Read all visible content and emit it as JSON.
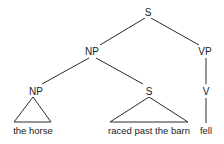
{
  "diagram": {
    "type": "syntax-parse-tree",
    "nodes": {
      "root": {
        "label": "S",
        "x": 148,
        "y": 8
      },
      "subject_np": {
        "label": "NP",
        "x": 92,
        "y": 47
      },
      "vp": {
        "label": "VP",
        "x": 205,
        "y": 47
      },
      "det_np": {
        "label": "NP",
        "x": 36,
        "y": 87
      },
      "relative_s": {
        "label": "S",
        "x": 149,
        "y": 87
      },
      "v": {
        "label": "V",
        "x": 206,
        "y": 87
      }
    },
    "leaves": {
      "np_leaf": {
        "text": "the horse",
        "x": 33,
        "y": 126
      },
      "s_leaf": {
        "text": "raced past the barn",
        "x": 149,
        "y": 126
      },
      "v_leaf": {
        "text": "fell",
        "x": 206,
        "y": 126
      }
    },
    "edges": [
      {
        "from": "S",
        "to": "NP",
        "x1": 145,
        "y1": 18,
        "x2": 100,
        "y2": 45
      },
      {
        "from": "S",
        "to": "VP",
        "x1": 151,
        "y1": 18,
        "x2": 199,
        "y2": 45
      },
      {
        "from": "NP",
        "to": "NP",
        "x1": 89,
        "y1": 58,
        "x2": 42,
        "y2": 84
      },
      {
        "from": "NP",
        "to": "S",
        "x1": 96,
        "y1": 58,
        "x2": 143,
        "y2": 84
      },
      {
        "from": "VP",
        "to": "V",
        "x1": 206,
        "y1": 58,
        "x2": 206,
        "y2": 84
      },
      {
        "from": "V",
        "to": "fell",
        "x1": 206,
        "y1": 98,
        "x2": 206,
        "y2": 123
      }
    ],
    "triangles": [
      {
        "node": "NP",
        "apex": [
          33,
          97
        ],
        "left": [
          14,
          122
        ],
        "right": [
          51,
          122
        ]
      },
      {
        "node": "S",
        "apex": [
          149,
          97
        ],
        "left": [
          110,
          122
        ],
        "right": [
          188,
          122
        ]
      }
    ],
    "colors": {
      "line": "#2a2a2a",
      "text": "#1a1a1a",
      "background": "#ffffff"
    }
  }
}
